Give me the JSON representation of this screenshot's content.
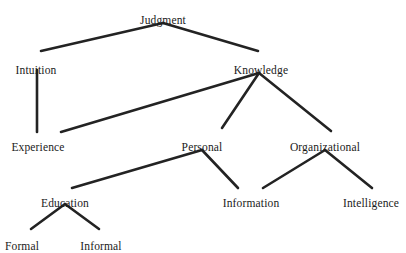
{
  "diagram": {
    "title": "Judgment",
    "type": "hierarchy-tree",
    "background_color": "#ffffff",
    "line_color": "#232323",
    "text_color": "#1a1a1a",
    "nodes": [
      {
        "id": "judgment",
        "label": "Judgment",
        "x": 163,
        "y": 14,
        "level": 0
      },
      {
        "id": "intuition",
        "label": "Intuition",
        "x": 36,
        "y": 64,
        "level": 1
      },
      {
        "id": "knowledge",
        "label": "Knowledge",
        "x": 261,
        "y": 64,
        "level": 1
      },
      {
        "id": "experience",
        "label": "Experience",
        "x": 38,
        "y": 141,
        "level": 2
      },
      {
        "id": "personal",
        "label": "Personal",
        "x": 202,
        "y": 141,
        "level": 2
      },
      {
        "id": "organizational",
        "label": "Organizational",
        "x": 325,
        "y": 141,
        "level": 2
      },
      {
        "id": "education",
        "label": "Education",
        "x": 65,
        "y": 197,
        "level": 3
      },
      {
        "id": "information",
        "label": "Information",
        "x": 251,
        "y": 197,
        "level": 3
      },
      {
        "id": "intelligence",
        "label": "Intelligence",
        "x": 371,
        "y": 197,
        "level": 3
      },
      {
        "id": "formal",
        "label": "Formal",
        "x": 22,
        "y": 240,
        "level": 4
      },
      {
        "id": "informal",
        "label": "Informal",
        "x": 101,
        "y": 240,
        "level": 4
      }
    ],
    "edges": [
      {
        "id": "judgment-intuition",
        "from": "judgment",
        "to": "intuition",
        "x1": 163,
        "y1": 23,
        "x2": 41,
        "y2": 51
      },
      {
        "id": "judgment-knowledge",
        "from": "judgment",
        "to": "knowledge",
        "x1": 163,
        "y1": 23,
        "x2": 258,
        "y2": 51
      },
      {
        "id": "intuition-experience",
        "from": "intuition",
        "to": "experience",
        "x1": 37,
        "y1": 70,
        "x2": 37,
        "y2": 132
      },
      {
        "id": "knowledge-experience",
        "from": "knowledge",
        "to": "experience",
        "x1": 259,
        "y1": 73,
        "x2": 61,
        "y2": 132
      },
      {
        "id": "knowledge-personal",
        "from": "knowledge",
        "to": "personal",
        "x1": 259,
        "y1": 73,
        "x2": 222,
        "y2": 128
      },
      {
        "id": "knowledge-organizational",
        "from": "knowledge",
        "to": "organizational",
        "x1": 259,
        "y1": 73,
        "x2": 331,
        "y2": 131
      },
      {
        "id": "personal-education",
        "from": "personal",
        "to": "education",
        "x1": 202,
        "y1": 150,
        "x2": 72,
        "y2": 188
      },
      {
        "id": "personal-information",
        "from": "personal",
        "to": "information",
        "x1": 202,
        "y1": 150,
        "x2": 238,
        "y2": 188
      },
      {
        "id": "organizational-information",
        "from": "organizational",
        "to": "information",
        "x1": 325,
        "y1": 150,
        "x2": 263,
        "y2": 188
      },
      {
        "id": "organizational-intelligence",
        "from": "organizational",
        "to": "intelligence",
        "x1": 325,
        "y1": 150,
        "x2": 372,
        "y2": 188
      },
      {
        "id": "education-formal",
        "from": "education",
        "to": "formal",
        "x1": 65,
        "y1": 204,
        "x2": 31,
        "y2": 229
      },
      {
        "id": "education-informal",
        "from": "education",
        "to": "informal",
        "x1": 65,
        "y1": 204,
        "x2": 99,
        "y2": 229
      }
    ]
  }
}
